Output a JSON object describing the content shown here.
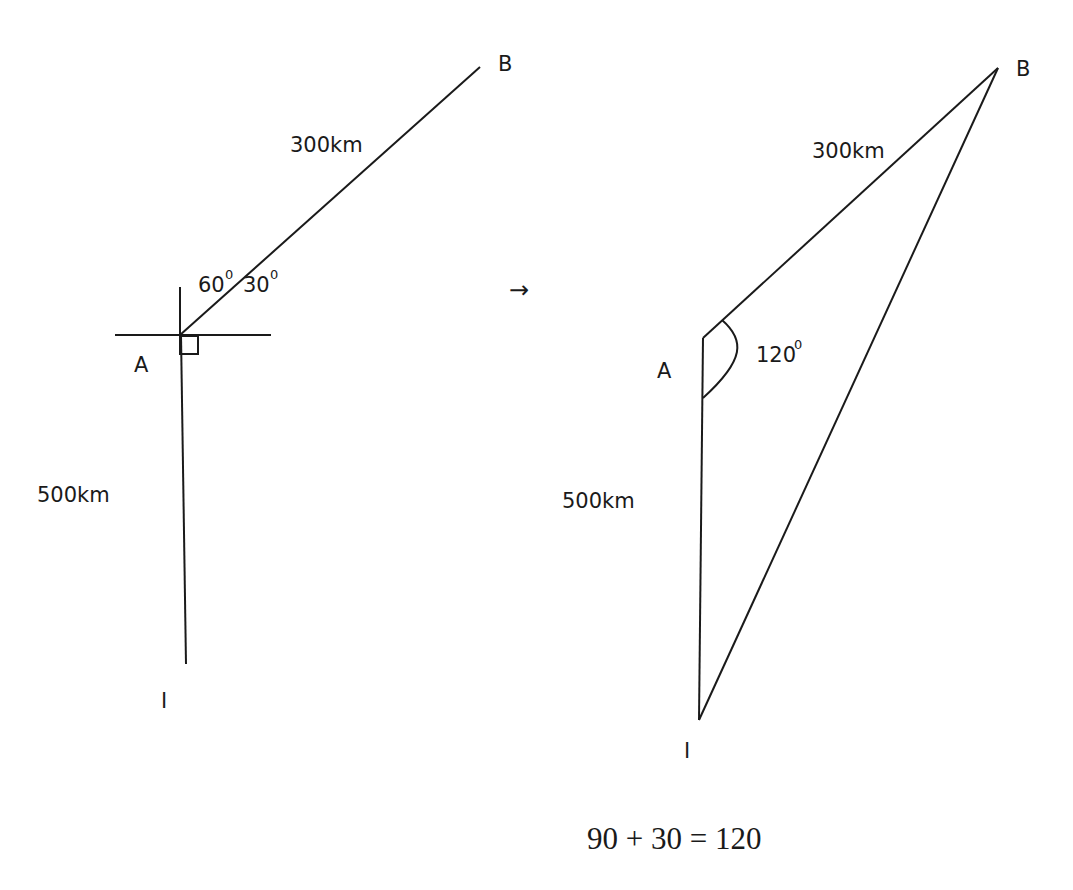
{
  "left_figure": {
    "point_B": "B",
    "point_A": "A",
    "point_I": "I",
    "distance_AB": "300km",
    "distance_AI": "500km",
    "angle_north": "60",
    "angle_east": "30",
    "degree_mark": "0"
  },
  "transition_arrow": "→",
  "right_figure": {
    "point_B": "B",
    "point_A": "A",
    "point_I": "I",
    "distance_AB": "300km",
    "distance_AI": "500km",
    "angle_IAB": "120",
    "degree_mark": "0"
  },
  "equation": "90 + 30 = 120"
}
